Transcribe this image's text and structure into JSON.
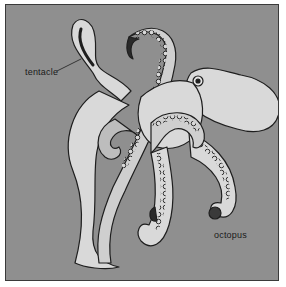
{
  "figure": {
    "background_color": "#8f8f8f",
    "body_fill_color": "#d9d9d9",
    "outline_color": "#1e1e1e",
    "labels": [
      {
        "id": "tentacle",
        "text": "tentacle",
        "points_to": "curled tentacle tip upper left"
      },
      {
        "id": "octopus",
        "text": "octopus"
      }
    ]
  }
}
